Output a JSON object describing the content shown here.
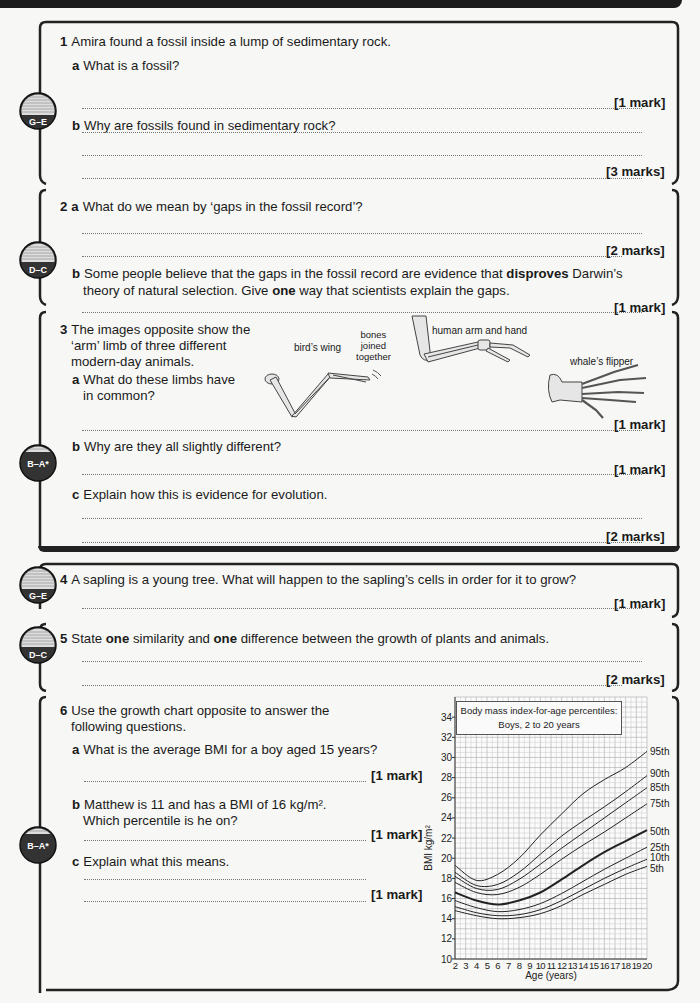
{
  "sections": [
    {
      "id": 1,
      "grade": "G–E",
      "intro": {
        "num": "1",
        "text": "Amira found a fossil inside a lump of sedimentary rock."
      },
      "parts": [
        {
          "letter": "a",
          "text": "What is a fossil?",
          "mark": "[1 mark]"
        },
        {
          "letter": "b",
          "text": "Why are fossils found in sedimentary rock?",
          "mark": "[3 marks]"
        }
      ]
    },
    {
      "id": 2,
      "grade": "D–C",
      "parts": [
        {
          "num": "2",
          "letter": "a",
          "text": "What do we mean by ‘gaps in the fossil record’?",
          "mark": "[2 marks]"
        },
        {
          "letter": "b",
          "text_before": "Some people believe that the gaps in the fossil record are evidence that ",
          "bold": "disproves",
          "text_after": " Darwin’s",
          "line2_before": "theory of natural selection. Give ",
          "line2_bold": "one",
          "line2_after": " way that scientists explain the gaps.",
          "mark": "[1 mark]"
        }
      ]
    },
    {
      "id": 3,
      "grade": "B–A*",
      "intro": {
        "num": "3",
        "lines": [
          "The images opposite show the",
          "‘arm’ limb of three different",
          "modern-day animals."
        ]
      },
      "figure": {
        "labels": {
          "bird": "bird’s wing",
          "bones": [
            "bones",
            "joined",
            "together"
          ],
          "human": "human arm and hand",
          "whale": "whale’s flipper"
        }
      },
      "parts": [
        {
          "letter": "a",
          "lines": [
            "What do these limbs have",
            "in common?"
          ],
          "mark": "[1 mark]"
        },
        {
          "letter": "b",
          "text": "Why are they all slightly different?",
          "mark": "[1 mark]"
        },
        {
          "letter": "c",
          "text": "Explain how this is evidence for evolution.",
          "mark": "[2 marks]"
        }
      ]
    },
    {
      "id": 4,
      "grade": "G–E",
      "intro": {
        "num": "4",
        "text": "A sapling is a young tree. What will happen to the sapling’s cells in order for it to grow?"
      },
      "mark": "[1 mark]"
    },
    {
      "id": 5,
      "grade": "D–C",
      "intro": {
        "num": "5",
        "before": "State ",
        "bold1": "one",
        "middle": " similarity and ",
        "bold2": "one",
        "after": " difference between the growth of plants and animals."
      },
      "mark": "[2 marks]"
    },
    {
      "id": 6,
      "grade": "B–A*",
      "intro": {
        "num": "6",
        "lines": [
          "Use the growth chart opposite to answer the",
          "following questions."
        ]
      },
      "parts": [
        {
          "letter": "a",
          "text": "What is the average BMI for a boy aged 15 years?",
          "mark": "[1 mark]"
        },
        {
          "letter": "b",
          "lines": [
            "Matthew is 11 and has a BMI of 16 kg/m².",
            "Which percentile is he on?"
          ],
          "mark": "[1 mark]"
        },
        {
          "letter": "c",
          "text": "Explain what this means.",
          "mark": "[1 mark]"
        }
      ]
    }
  ],
  "chart_data": {
    "type": "line",
    "title": "Body mass index-for-age percentiles:",
    "subtitle": "Boys, 2 to 20 years",
    "xlabel": "Age (years)",
    "ylabel": "BMI kg/m²",
    "xlim": [
      2,
      20
    ],
    "ylim": [
      10,
      36
    ],
    "x_ticks": [
      2,
      3,
      4,
      5,
      6,
      7,
      8,
      9,
      10,
      11,
      12,
      13,
      14,
      15,
      16,
      17,
      18,
      19,
      20
    ],
    "y_ticks": [
      10,
      12,
      14,
      16,
      18,
      20,
      22,
      24,
      26,
      28,
      30,
      32,
      34
    ],
    "grid": true,
    "x": [
      2,
      4,
      6,
      8,
      10,
      12,
      14,
      16,
      18,
      20
    ],
    "series": [
      {
        "name": "95th",
        "values": [
          19.3,
          17.8,
          18.4,
          20.0,
          22.3,
          24.4,
          26.4,
          27.8,
          29.0,
          30.6
        ]
      },
      {
        "name": "90th",
        "values": [
          18.6,
          17.3,
          17.4,
          18.6,
          20.4,
          22.2,
          23.7,
          25.1,
          26.6,
          28.2
        ]
      },
      {
        "name": "85th",
        "values": [
          18.2,
          17.0,
          16.9,
          17.9,
          19.4,
          21.0,
          22.5,
          24.0,
          25.5,
          27.0
        ]
      },
      {
        "name": "75th",
        "values": [
          17.6,
          16.6,
          16.4,
          17.1,
          18.4,
          19.9,
          21.3,
          22.6,
          24.0,
          25.4
        ]
      },
      {
        "name": "50th",
        "values": [
          16.6,
          15.8,
          15.4,
          15.8,
          16.6,
          17.9,
          19.3,
          20.6,
          21.7,
          22.8
        ]
      },
      {
        "name": "25th",
        "values": [
          15.8,
          15.1,
          14.7,
          14.9,
          15.5,
          16.5,
          17.7,
          18.9,
          20.0,
          21.1
        ]
      },
      {
        "name": "10th",
        "values": [
          15.2,
          14.6,
          14.3,
          14.4,
          14.9,
          15.8,
          16.9,
          18.0,
          19.0,
          19.9
        ]
      },
      {
        "name": "5th",
        "values": [
          14.8,
          14.3,
          14.0,
          14.1,
          14.5,
          15.3,
          16.4,
          17.4,
          18.4,
          19.2
        ]
      }
    ],
    "legend_position": "right-end labels"
  }
}
